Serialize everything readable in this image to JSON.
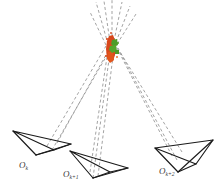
{
  "figure": {
    "kind": "multi-view-triangulation-diagram",
    "background_color": "#ffffff",
    "width": 223,
    "height": 196
  },
  "cameras": [
    {
      "id": "cam-k",
      "label_base": "O",
      "label_sub": "k",
      "label_text": "O",
      "subscript_text": "k",
      "apex": {
        "x": 36,
        "y": 155
      },
      "image_plane": [
        {
          "x": 13,
          "y": 131
        },
        {
          "x": 71,
          "y": 144
        },
        {
          "x": 54,
          "y": 150
        }
      ],
      "stroke_color": "#1a1a1a"
    },
    {
      "id": "cam-k-plus-1",
      "label_base": "O",
      "label_sub": "k+1",
      "label_text": "O",
      "subscript_text": "k+1",
      "apex": {
        "x": 93,
        "y": 178
      },
      "image_plane": [
        {
          "x": 70,
          "y": 151
        },
        {
          "x": 128,
          "y": 168
        },
        {
          "x": 110,
          "y": 172
        }
      ],
      "stroke_color": "#1a1a1a"
    },
    {
      "id": "cam-k-plus-2",
      "label_base": "O",
      "label_sub": "k+2",
      "label_text": "O",
      "subscript_text": "k+2",
      "apex": {
        "x": 178,
        "y": 172
      },
      "image_plane": [
        {
          "x": 155,
          "y": 148
        },
        {
          "x": 213,
          "y": 140
        },
        {
          "x": 196,
          "y": 164
        }
      ],
      "stroke_color": "#1a1a1a"
    }
  ],
  "convergence": {
    "label": "triangulated-point-cluster",
    "center": {
      "x": 112,
      "y": 48
    },
    "colors": {
      "primary": "#d8481c",
      "secondary": "#4e9c28",
      "accent": "#e2641f"
    }
  },
  "rays": {
    "label": "projection-rays",
    "stroke_color": "#8c8c8c",
    "dash_pattern": "3,2.4",
    "stroke_width": 0.8,
    "count": 12
  },
  "style": {
    "frustum_stroke": "#1a1a1a",
    "frustum_width": 1.15,
    "label_color": "#3a3a3a"
  }
}
